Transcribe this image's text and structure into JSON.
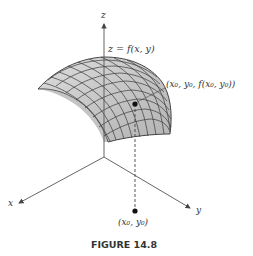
{
  "figure": {
    "caption": "FIGURE 14.8",
    "surface_label": "z = f(x, y)",
    "point_label": "(x₀, y₀, f(x₀, y₀))",
    "base_point_label": "(x₀, y₀)",
    "axes": {
      "x_label": "x",
      "y_label": "y",
      "z_label": "z"
    },
    "colors": {
      "surface_fill": "#cfcfcf",
      "surface_shade": "#a9a9a9",
      "grid": "#3a3a3a",
      "axis": "#444444",
      "point": "#111111"
    }
  }
}
